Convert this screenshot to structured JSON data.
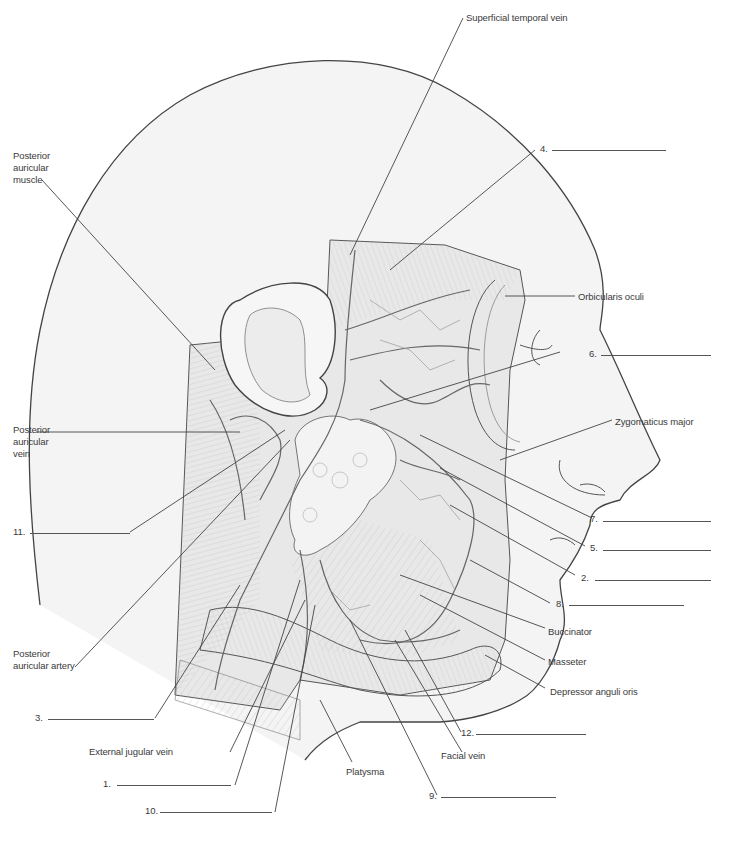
{
  "colors": {
    "line": "#444444",
    "skin_fill": "#f2f2f2",
    "muscle_fill": "#e6e6e6",
    "label_text": "#3a3a3a"
  },
  "given_labels": {
    "superficial_temporal_vein": "Superficial temporal vein",
    "posterior_auricular_muscle": [
      "Posterior",
      "auricular",
      "muscle"
    ],
    "orbicularis_oculi": "Orbicularis oculi",
    "zygomaticus_major": "Zygomaticus major",
    "posterior_auricular_vein": [
      "Posterior",
      "auricular",
      "vein"
    ],
    "buccinator": "Buccinator",
    "masseter": "Masseter",
    "depressor_anguli_oris": "Depressor anguli oris",
    "posterior_auricular_artery": [
      "Posterior",
      "auricular artery"
    ],
    "external_jugular_vein": "External jugular vein",
    "platysma": "Platysma",
    "facial_vein": "Facial vein"
  },
  "numbered_blanks": [
    {
      "number": "1.",
      "answer": ""
    },
    {
      "number": "2.",
      "answer": ""
    },
    {
      "number": "3.",
      "answer": ""
    },
    {
      "number": "4.",
      "answer": ""
    },
    {
      "number": "5.",
      "answer": ""
    },
    {
      "number": "6.",
      "answer": ""
    },
    {
      "number": "7.",
      "answer": ""
    },
    {
      "number": "8.",
      "answer": ""
    },
    {
      "number": "9.",
      "answer": ""
    },
    {
      "number": "10.",
      "answer": ""
    },
    {
      "number": "11.",
      "answer": ""
    },
    {
      "number": "12.",
      "answer": ""
    }
  ]
}
